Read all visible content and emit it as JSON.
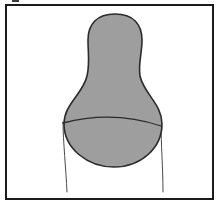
{
  "figure": {
    "title": "Shaded bulb-shaped region with horizon arc inside rectangular frame",
    "type": "line-drawing",
    "canvas": {
      "width": 221,
      "height": 206
    },
    "colors": {
      "background": "#ffffff",
      "frame_stroke": "#1b1b1b",
      "shape_fill": "#9e9e9e",
      "shape_stroke": "#2b2b2b",
      "thin_line_stroke": "#4a4a4a",
      "arc_stroke": "#2b2b2b",
      "corner_mark": "#3a3a3a"
    },
    "frame": {
      "name": "rectangular border",
      "x": 6,
      "y": 5,
      "width": 207,
      "height": 194,
      "stroke_width": 2
    },
    "corner_mark": {
      "name": "small tick above top-left of frame",
      "x": 12,
      "y": 0,
      "width": 7,
      "height": 2
    },
    "blob": {
      "name": "shaded bulb / pear-shaped body",
      "fill": "#9e9e9e",
      "stroke_width": 1.6,
      "path": "M 115 14 C 133 14 142 24 142 40 C 142 54 138 64 140 76 C 144 94 162 104 162 124 C 162 148 141 167 114 167 C 87 167 64 148 64 124 C 64 104 83 94 87 76 C 90 64 88 53 88 40 C 88 24 97 14 115 14 Z",
      "bounds": {
        "top": 14,
        "bottom": 167,
        "left": 63,
        "right": 162
      },
      "dome_top_y": 14,
      "neck_width_px": 54,
      "belly_width_px": 99
    },
    "horizon_arc": {
      "name": "curved horizon line across the blob",
      "path": "M 63 123 Q 113 110 161 126",
      "stroke_width": 1.3,
      "left_endpoint": [
        63,
        123
      ],
      "right_endpoint": [
        161,
        126
      ],
      "apex": [
        113,
        116
      ]
    },
    "thin_lines": [
      {
        "name": "left thin trailing line",
        "path": "M 63 122 C 63 140 66 170 67 192",
        "stroke_width": 1,
        "start": [
          63,
          122
        ],
        "end": [
          67,
          192
        ]
      },
      {
        "name": "right thin trailing line",
        "path": "M 161 125 C 161 142 163 170 163 192",
        "stroke_width": 1,
        "start": [
          161,
          125
        ],
        "end": [
          163,
          192
        ]
      }
    ]
  }
}
